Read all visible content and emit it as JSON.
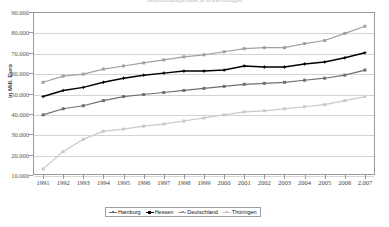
{
  "chart": {
    "title": "Bruttoinlandsprodukt je Erwerbstätigen",
    "ylabel": "in Mill. Euro"
  },
  "legend": {
    "position": "bottom",
    "items": [
      {
        "label": "Hamburg",
        "color": "#6f6f6f",
        "marker": "square"
      },
      {
        "label": "Hessen",
        "color": "#000000",
        "marker": "plus"
      },
      {
        "label": "Deutschland",
        "color": "#a0a0a0",
        "marker": "square"
      },
      {
        "label": "Thüringen",
        "color": "#c9c9c9",
        "marker": "square"
      }
    ]
  },
  "chart_data": {
    "type": "line",
    "title": "Bruttoinlandsprodukt je Erwerbstätigen",
    "xlabel": "",
    "ylabel": "in Mill. Euro",
    "grid": true,
    "ylim": [
      0,
      90000
    ],
    "yticks": [
      10000,
      20000,
      30000,
      40000,
      50000,
      60000,
      70000,
      80000,
      90000
    ],
    "ytick_labels": [
      "10.000",
      "20.000",
      "30.000",
      "40.000",
      "50.000",
      "60.000",
      "70.000",
      "80.000",
      "90.000"
    ],
    "categories": [
      "1991",
      "1992",
      "1993",
      "1994",
      "1995",
      "1996",
      "1997",
      "1998",
      "1999",
      "2000",
      "2001",
      "2002",
      "2003",
      "2004",
      "2005",
      "2006",
      "2.007"
    ],
    "x": [
      1991,
      1992,
      1993,
      1994,
      1995,
      1996,
      1997,
      1998,
      1999,
      2000,
      2001,
      2002,
      2003,
      2004,
      2005,
      2006,
      2007
    ],
    "series": [
      {
        "name": "Deutschland",
        "color": "#a0a0a0",
        "marker": "square",
        "values": [
          55500,
          58500,
          59500,
          62000,
          63500,
          65000,
          66500,
          68000,
          69000,
          70500,
          72000,
          72500,
          72500,
          74500,
          76000,
          79500,
          83000
        ]
      },
      {
        "name": "Hessen",
        "color": "#000000",
        "marker": "plus",
        "values": [
          48500,
          51500,
          53000,
          55500,
          57500,
          59000,
          60000,
          61000,
          61000,
          61500,
          63500,
          63000,
          63000,
          64500,
          65500,
          67500,
          70000
        ]
      },
      {
        "name": "Hamburg",
        "color": "#6f6f6f",
        "marker": "square",
        "values": [
          39500,
          42500,
          44000,
          46500,
          48500,
          49500,
          50500,
          51500,
          52500,
          53500,
          54500,
          55000,
          55500,
          56500,
          57500,
          59000,
          61500
        ]
      },
      {
        "name": "Thüringen",
        "color": "#c9c9c9",
        "marker": "square",
        "values": [
          13000,
          21500,
          27500,
          31500,
          32500,
          34000,
          35000,
          36500,
          38000,
          39500,
          41000,
          41500,
          42500,
          43500,
          44500,
          46500,
          48500
        ]
      }
    ]
  }
}
